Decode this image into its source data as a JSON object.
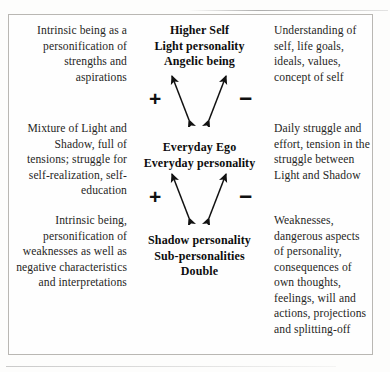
{
  "diagram": {
    "title_semantic": "Higher Self / Everyday Ego / Shadow personality structure",
    "rows": [
      {
        "id": "higher-self",
        "left": "Intrinsic being as a personification of strengths and aspirations",
        "center": "Higher Self\nLight personality\nAngelic being",
        "center_lines": [
          "Higher Self",
          "Light personality",
          "Angelic being"
        ],
        "right": "Understanding of self, life goals, ideals, values, concept of self"
      },
      {
        "id": "everyday-ego",
        "left": "Mixture of Light and Shadow, full of tensions; struggle for self-realization, self-education",
        "center": "Everyday Ego\nEveryday personality",
        "center_lines": [
          "Everyday Ego",
          "Everyday personality"
        ],
        "right": "Daily struggle and effort, tension in the struggle between Light and Shadow"
      },
      {
        "id": "shadow-personality",
        "left": "Intrinsic being, personification of weaknesses as well as negative characteristics and interpretations",
        "center": "Shadow personality\nSub-personalities\nDouble",
        "center_lines": [
          "Shadow personality",
          "Sub-personalities",
          "Double"
        ],
        "right": "Weaknesses, dangerous aspects of personality, consequences of own thoughts, feelings, will and actions, projections and splitting-off"
      }
    ],
    "connectors": [
      {
        "id": "upper",
        "between": [
          "Higher Self",
          "Everyday Ego"
        ],
        "plus_sign": "+",
        "minus_sign": "–",
        "style": "two double-headed diagonal arrows"
      },
      {
        "id": "lower",
        "between": [
          "Everyday Ego",
          "Shadow personality"
        ],
        "plus_sign": "+",
        "minus_sign": "–",
        "style": "two double-headed diagonal arrows"
      }
    ],
    "colors": {
      "ink": "#1b1b1b",
      "heading_ink": "#0d0d0d",
      "border": "#b9b7b3",
      "page_background": "#fdfdfc",
      "frame_background": "#fefefe"
    }
  }
}
